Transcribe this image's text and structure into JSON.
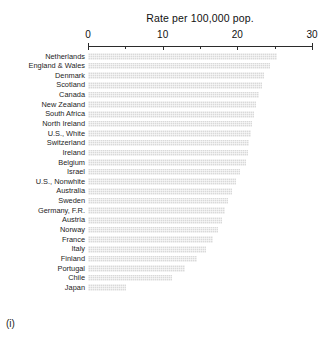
{
  "chart_data": {
    "type": "bar",
    "orientation": "horizontal",
    "title": "Rate per 100,000 pop.",
    "xlabel": "",
    "ylabel": "",
    "xlim": [
      0,
      30
    ],
    "grid": false,
    "legend": null,
    "ticks": [
      {
        "value": 0,
        "label": "0",
        "major": true
      },
      {
        "value": 5,
        "label": "",
        "major": false
      },
      {
        "value": 10,
        "label": "10",
        "major": true
      },
      {
        "value": 15,
        "label": "",
        "major": false
      },
      {
        "value": 20,
        "label": "20",
        "major": true
      },
      {
        "value": 25,
        "label": "",
        "major": false
      },
      {
        "value": 30,
        "label": "30",
        "major": true
      }
    ],
    "categories": [
      "Netherlands",
      "England & Wales",
      "Denmark",
      "Scotland",
      "Canada",
      "New Zealand",
      "South Africa",
      "North Ireland",
      "U.S., White",
      "Switzerland",
      "Ireland",
      "Belgium",
      "Israel",
      "U.S., Nonwhite",
      "Australia",
      "Sweden",
      "Germany, F.R.",
      "Austria",
      "Norway",
      "France",
      "Italy",
      "Finland",
      "Portugal",
      "Chile",
      "Japan"
    ],
    "values": [
      25.3,
      24.4,
      23.6,
      23.3,
      22.9,
      22.5,
      22.2,
      22.0,
      21.8,
      21.6,
      21.4,
      21.1,
      20.4,
      19.8,
      19.3,
      18.8,
      18.4,
      18.0,
      17.4,
      16.8,
      15.8,
      14.6,
      13.0,
      11.2,
      5.1
    ]
  },
  "caption": "(i)",
  "colors": {
    "bar": "#d9d9d9",
    "axis": "#2b2b2b",
    "text": "#1b1b1b"
  }
}
